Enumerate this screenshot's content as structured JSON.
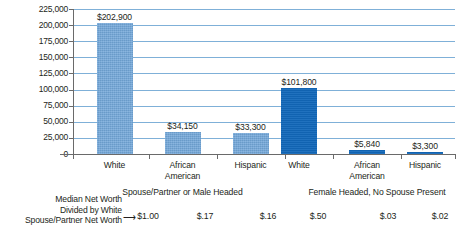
{
  "chart_data": {
    "type": "bar",
    "title": "",
    "xlabel": "",
    "ylabel": "Median Net Worth in Dollars",
    "ylim": [
      0,
      225000
    ],
    "ytick_step": 25000,
    "ytick_labels": [
      "225,000",
      "200,000",
      "175,000",
      "150,000",
      "125,000",
      "100,000",
      "75,000",
      "50,000",
      "25,000",
      "0"
    ],
    "ytick_values": [
      225000,
      200000,
      175000,
      150000,
      125000,
      100000,
      75000,
      50000,
      25000,
      0
    ],
    "grid": true,
    "legend": "none",
    "categories": [
      "White",
      "African American",
      "Hispanic",
      "White",
      "African American",
      "Hispanic"
    ],
    "values": [
      202900,
      34150,
      33300,
      101800,
      5840,
      3300
    ],
    "value_labels": [
      "$202,900",
      "$34,150",
      "$33,300",
      "$101,800",
      "$5,840",
      "$3,300"
    ],
    "bar_colors": [
      "#72a7d9",
      "#72a7d9",
      "#72a7d9",
      "#1268ba",
      "#1268ba",
      "#1268ba"
    ],
    "groups": [
      {
        "label": "Spouse/Partner or Male Headed",
        "categories": [
          "White",
          "African American",
          "Hispanic"
        ]
      },
      {
        "label": "Female Headed, No Spouse Present",
        "categories": [
          "White",
          "African American",
          "Hispanic"
        ]
      }
    ],
    "annotation": {
      "caption_lines": [
        "Median Net Worth",
        "Divided by White",
        "Spouse/Partner Net Worth"
      ],
      "arrow": "⟶",
      "ratios": [
        "$1.00",
        "$.17",
        "$.16",
        "$.50",
        "$.03",
        "$.02"
      ]
    },
    "colors": {
      "light_bar": "#72a7d9",
      "dark_bar": "#1268ba",
      "gridline": "#7fb0d8",
      "axis": "#6a6a6a",
      "text": "#231f20",
      "background": "#ffffff"
    }
  },
  "categories_display": [
    [
      "White"
    ],
    [
      "African",
      "American"
    ],
    [
      "Hispanic"
    ],
    [
      "White"
    ],
    [
      "African",
      "American"
    ],
    [
      "Hispanic"
    ]
  ]
}
